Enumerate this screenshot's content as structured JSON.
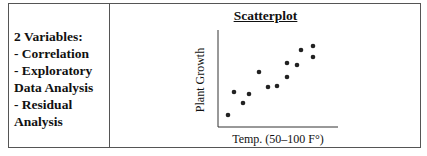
{
  "left_panel": {
    "lines": [
      "2 Variables:",
      "- Correlation",
      "- Exploratory",
      "Data Analysis",
      "- Residual",
      "Analysis"
    ]
  },
  "chart_data": {
    "type": "scatter",
    "title": "Scatterplot",
    "xlabel": "Temp. (50–100 F°)",
    "ylabel": "Plant Growth",
    "grid": false,
    "legend": null,
    "points_px": [
      [
        228,
        115
      ],
      [
        234,
        92
      ],
      [
        243,
        103
      ],
      [
        249,
        94
      ],
      [
        259,
        72
      ],
      [
        268,
        87
      ],
      [
        277,
        86
      ],
      [
        287,
        77
      ],
      [
        287,
        63
      ],
      [
        297,
        65
      ],
      [
        301,
        50
      ],
      [
        313,
        57
      ],
      [
        313,
        46
      ]
    ],
    "x": [
      53,
      58,
      63,
      66,
      72,
      77,
      82,
      87,
      87,
      93,
      95,
      100,
      100
    ],
    "y": [
      12,
      35,
      24,
      33,
      55,
      40,
      41,
      50,
      64,
      62,
      77,
      70,
      81
    ]
  }
}
